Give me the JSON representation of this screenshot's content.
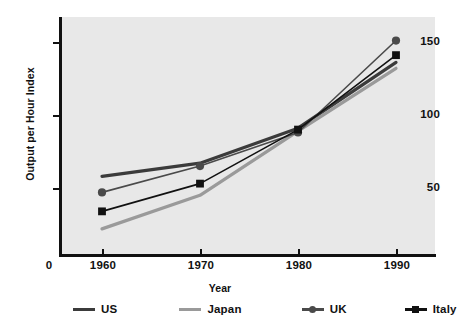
{
  "chart_data": {
    "type": "line",
    "title": "",
    "xlabel": "Year",
    "ylabel": "Output per Hour Index",
    "x": [
      1960,
      1970,
      1980,
      1990
    ],
    "categories": [
      "1960",
      "1970",
      "1980",
      "1990"
    ],
    "xtick_labels": [
      "0",
      "1960",
      "1970",
      "1980",
      "1990"
    ],
    "ytick_labels": [
      "50",
      "100",
      "150"
    ],
    "yticks": [
      50,
      100,
      150
    ],
    "ylim": [
      0,
      163
    ],
    "xlim": [
      1955.5,
      1994
    ],
    "grid": false,
    "legend_position": "bottom",
    "plot_background": "#e8e8e8",
    "series": [
      {
        "name": "US",
        "values": [
          58,
          67,
          91,
          136
        ],
        "color": "#3b3b3b",
        "marker": "none",
        "line_width": 3.2
      },
      {
        "name": "Japan",
        "values": [
          22,
          45,
          89,
          132
        ],
        "color": "#9a9a9a",
        "marker": "none",
        "line_width": 3.2
      },
      {
        "name": "UK",
        "values": [
          47,
          65,
          88,
          151
        ],
        "color": "#4a4a4a",
        "marker": "circle",
        "line_width": 1.6
      },
      {
        "name": "Italy",
        "values": [
          34,
          53,
          90,
          141
        ],
        "color": "#111111",
        "marker": "square",
        "line_width": 1.6
      }
    ]
  },
  "axes": {
    "y_title": "Output per Hour Index",
    "x_title": "Year",
    "y_ticks": [
      {
        "label": "150",
        "value": 150
      },
      {
        "label": "100",
        "value": 100
      },
      {
        "label": "50",
        "value": 50
      }
    ],
    "x_ticks": [
      {
        "label": "0",
        "value": null
      },
      {
        "label": "1960",
        "value": 1960
      },
      {
        "label": "1970",
        "value": 1970
      },
      {
        "label": "1980",
        "value": 1980
      },
      {
        "label": "1990",
        "value": 1990
      }
    ]
  },
  "legend": {
    "items": [
      {
        "label": "US",
        "color": "#3b3b3b",
        "marker": "none"
      },
      {
        "label": "Japan",
        "color": "#9a9a9a",
        "marker": "none"
      },
      {
        "label": "UK",
        "color": "#4a4a4a",
        "marker": "circle"
      },
      {
        "label": "Italy",
        "color": "#111111",
        "marker": "square"
      }
    ]
  }
}
